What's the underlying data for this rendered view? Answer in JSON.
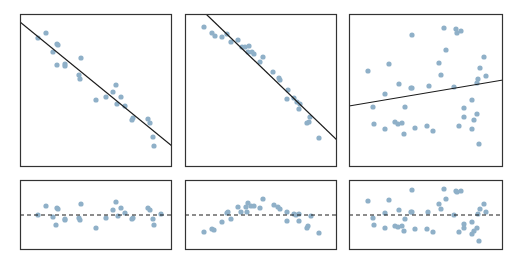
{
  "chart_data": [
    {
      "type": "scatter",
      "title": "",
      "xlabel": "",
      "ylabel": "",
      "grid": false,
      "panel": {
        "x": 20,
        "y": 14,
        "w": 152,
        "h": 153
      },
      "fit_line": {
        "x1": 20,
        "y1": 22,
        "x2": 172,
        "y2": 146
      },
      "points_px": [
        [
          38,
          38
        ],
        [
          46,
          33
        ],
        [
          57,
          44
        ],
        [
          58,
          45
        ],
        [
          53,
          52
        ],
        [
          57,
          65
        ],
        [
          65,
          64
        ],
        [
          65,
          66
        ],
        [
          81,
          58
        ],
        [
          79,
          75
        ],
        [
          80,
          79
        ],
        [
          96,
          100
        ],
        [
          106,
          97
        ],
        [
          116,
          85
        ],
        [
          113,
          92
        ],
        [
          121,
          97
        ],
        [
          117,
          104
        ],
        [
          125,
          106
        ],
        [
          132,
          120
        ],
        [
          133,
          118
        ],
        [
          148,
          119
        ],
        [
          150,
          123
        ],
        [
          153,
          137
        ],
        [
          154,
          146
        ]
      ],
      "description": "Strong negative linear relationship with linear fit"
    },
    {
      "type": "scatter",
      "title": "",
      "xlabel": "",
      "ylabel": "",
      "grid": false,
      "panel": {
        "x": 185,
        "y": 14,
        "w": 152,
        "h": 153
      },
      "fit_line": {
        "x1": 206,
        "y1": 14,
        "x2": 337,
        "y2": 140
      },
      "points_px": [
        [
          204,
          27
        ],
        [
          212,
          33
        ],
        [
          215,
          36
        ],
        [
          222,
          37
        ],
        [
          227,
          34
        ],
        [
          231,
          42
        ],
        [
          238,
          40
        ],
        [
          242,
          47
        ],
        [
          245,
          47
        ],
        [
          249,
          46
        ],
        [
          248,
          52
        ],
        [
          252,
          52
        ],
        [
          254,
          54
        ],
        [
          263,
          57
        ],
        [
          260,
          62
        ],
        [
          273,
          72
        ],
        [
          279,
          78
        ],
        [
          280,
          80
        ],
        [
          288,
          90
        ],
        [
          287,
          99
        ],
        [
          294,
          98
        ],
        [
          297,
          102
        ],
        [
          300,
          104
        ],
        [
          299,
          109
        ],
        [
          310,
          117
        ],
        [
          307,
          123
        ],
        [
          309,
          122
        ],
        [
          319,
          138
        ]
      ],
      "description": "Negative curved relationship with linear fit"
    },
    {
      "type": "scatter",
      "title": "",
      "xlabel": "",
      "ylabel": "",
      "grid": false,
      "panel": {
        "x": 349,
        "y": 14,
        "w": 154,
        "h": 153
      },
      "fit_line": {
        "x1": 349,
        "y1": 106,
        "x2": 503,
        "y2": 80
      },
      "points_px": [
        [
          444,
          28
        ],
        [
          456,
          29
        ],
        [
          457,
          33
        ],
        [
          461,
          31
        ],
        [
          412,
          35
        ],
        [
          446,
          50
        ],
        [
          484,
          57
        ],
        [
          389,
          64
        ],
        [
          439,
          63
        ],
        [
          368,
          71
        ],
        [
          480,
          68
        ],
        [
          441,
          75
        ],
        [
          486,
          76
        ],
        [
          478,
          79
        ],
        [
          399,
          84
        ],
        [
          411,
          88
        ],
        [
          412,
          88
        ],
        [
          429,
          86
        ],
        [
          454,
          87
        ],
        [
          477,
          83
        ],
        [
          385,
          94
        ],
        [
          472,
          100
        ],
        [
          373,
          107
        ],
        [
          405,
          107
        ],
        [
          464,
          108
        ],
        [
          477,
          114
        ],
        [
          464,
          117
        ],
        [
          474,
          120
        ],
        [
          395,
          122
        ],
        [
          398,
          124
        ],
        [
          402,
          123
        ],
        [
          374,
          124
        ],
        [
          427,
          126
        ],
        [
          459,
          126
        ],
        [
          415,
          128
        ],
        [
          385,
          129
        ],
        [
          404,
          134
        ],
        [
          433,
          131
        ],
        [
          472,
          129
        ],
        [
          479,
          144
        ]
      ],
      "description": "Weak relationship with nearly flat linear fit"
    },
    {
      "type": "scatter",
      "title": "Residuals",
      "xlabel": "",
      "ylabel": "",
      "grid": false,
      "panel": {
        "x": 20,
        "y": 180,
        "w": 152,
        "h": 70
      },
      "zero_line_y": 215,
      "points_px": [
        [
          38,
          215
        ],
        [
          46,
          206
        ],
        [
          53,
          217
        ],
        [
          57,
          208
        ],
        [
          58,
          209
        ],
        [
          56,
          225
        ],
        [
          65,
          219
        ],
        [
          65,
          220
        ],
        [
          81,
          204
        ],
        [
          79,
          218
        ],
        [
          80,
          220
        ],
        [
          96,
          228
        ],
        [
          106,
          218
        ],
        [
          116,
          202
        ],
        [
          113,
          210
        ],
        [
          121,
          208
        ],
        [
          118,
          216
        ],
        [
          125,
          213
        ],
        [
          132,
          219
        ],
        [
          133,
          218
        ],
        [
          148,
          208
        ],
        [
          150,
          210
        ],
        [
          153,
          219
        ],
        [
          154,
          225
        ],
        [
          161,
          214
        ]
      ]
    },
    {
      "type": "scatter",
      "title": "Residuals",
      "xlabel": "",
      "ylabel": "",
      "grid": false,
      "panel": {
        "x": 185,
        "y": 180,
        "w": 152,
        "h": 70
      },
      "zero_line_y": 215,
      "points_px": [
        [
          204,
          232
        ],
        [
          212,
          229
        ],
        [
          214,
          230
        ],
        [
          222,
          222
        ],
        [
          227,
          213
        ],
        [
          228,
          212
        ],
        [
          231,
          219
        ],
        [
          238,
          207
        ],
        [
          241,
          212
        ],
        [
          246,
          207
        ],
        [
          247,
          212
        ],
        [
          248,
          203
        ],
        [
          251,
          206
        ],
        [
          254,
          206
        ],
        [
          260,
          208
        ],
        [
          263,
          199
        ],
        [
          274,
          205
        ],
        [
          278,
          207
        ],
        [
          280,
          209
        ],
        [
          287,
          212
        ],
        [
          287,
          221
        ],
        [
          294,
          214
        ],
        [
          296,
          215
        ],
        [
          299,
          214
        ],
        [
          299,
          221
        ],
        [
          311,
          216
        ],
        [
          307,
          228
        ],
        [
          308,
          226
        ],
        [
          319,
          233
        ]
      ]
    },
    {
      "type": "scatter",
      "title": "Residuals",
      "xlabel": "",
      "ylabel": "",
      "grid": false,
      "panel": {
        "x": 349,
        "y": 180,
        "w": 154,
        "h": 70
      },
      "zero_line_y": 215,
      "points_px": [
        [
          368,
          201
        ],
        [
          389,
          200
        ],
        [
          412,
          190
        ],
        [
          444,
          189
        ],
        [
          456,
          191
        ],
        [
          457,
          192
        ],
        [
          461,
          191
        ],
        [
          446,
          199
        ],
        [
          439,
          204
        ],
        [
          441,
          209
        ],
        [
          484,
          204
        ],
        [
          480,
          209
        ],
        [
          486,
          212
        ],
        [
          478,
          214
        ],
        [
          399,
          210
        ],
        [
          385,
          213
        ],
        [
          411,
          212
        ],
        [
          412,
          212
        ],
        [
          428,
          212
        ],
        [
          454,
          215
        ],
        [
          373,
          218
        ],
        [
          405,
          219
        ],
        [
          374,
          225
        ],
        [
          385,
          228
        ],
        [
          395,
          226
        ],
        [
          398,
          227
        ],
        [
          402,
          226
        ],
        [
          404,
          231
        ],
        [
          415,
          229
        ],
        [
          427,
          229
        ],
        [
          433,
          232
        ],
        [
          459,
          232
        ],
        [
          464,
          224
        ],
        [
          464,
          228
        ],
        [
          472,
          222
        ],
        [
          477,
          228
        ],
        [
          474,
          231
        ],
        [
          472,
          234
        ],
        [
          479,
          241
        ]
      ]
    }
  ],
  "colors": {
    "point": "#8fb0c8",
    "frame": "#333333",
    "fit_line": "#1a1a1a",
    "zero_line": "#1a1a1a"
  }
}
